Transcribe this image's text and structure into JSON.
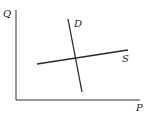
{
  "diagram": {
    "type": "supply-demand",
    "axes": {
      "y_label": "Q",
      "x_label": "P",
      "origin": [
        16,
        100
      ],
      "y_top": [
        16,
        10
      ],
      "x_end": [
        140,
        100
      ]
    },
    "curves": [
      {
        "name": "D",
        "label": "D",
        "from": [
          68,
          19
        ],
        "to": [
          82,
          92
        ],
        "label_pos": [
          74,
          26
        ]
      },
      {
        "name": "S",
        "label": "S",
        "from": [
          37,
          64
        ],
        "to": [
          128,
          50
        ],
        "label_pos": [
          123,
          61
        ]
      }
    ],
    "colors": {
      "line": "#2a2a2a",
      "background": "#ffffff"
    }
  }
}
